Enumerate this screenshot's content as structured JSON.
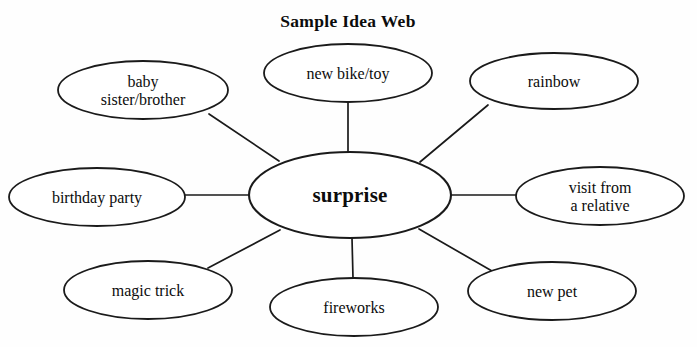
{
  "title": "Sample Idea Web",
  "diagram": {
    "type": "idea-web",
    "center": {
      "id": "surprise",
      "label": "surprise",
      "cx": 350,
      "cy": 195,
      "rx": 101,
      "ry": 43
    },
    "nodes": [
      {
        "id": "baby-sister-brother",
        "lines": [
          "baby",
          "sister/brother"
        ],
        "label": "baby sister/brother",
        "cx": 143,
        "cy": 90,
        "rx": 85,
        "ry": 29
      },
      {
        "id": "new-bike-toy",
        "lines": [
          "new bike/toy"
        ],
        "label": "new bike/toy",
        "cx": 348,
        "cy": 73,
        "rx": 84,
        "ry": 29
      },
      {
        "id": "rainbow",
        "lines": [
          "rainbow"
        ],
        "label": "rainbow",
        "cx": 554,
        "cy": 81,
        "rx": 84,
        "ry": 28
      },
      {
        "id": "visit-from-a-relative",
        "lines": [
          "visit from",
          "a relative"
        ],
        "label": "visit from a relative",
        "cx": 600,
        "cy": 196,
        "rx": 84,
        "ry": 29
      },
      {
        "id": "new-pet",
        "lines": [
          "new pet"
        ],
        "label": "new pet",
        "cx": 552,
        "cy": 291,
        "rx": 84,
        "ry": 29
      },
      {
        "id": "fireworks",
        "lines": [
          "fireworks"
        ],
        "label": "fireworks",
        "cx": 354,
        "cy": 307,
        "rx": 84,
        "ry": 29
      },
      {
        "id": "magic-trick",
        "lines": [
          "magic trick"
        ],
        "label": "magic trick",
        "cx": 148,
        "cy": 290,
        "rx": 84,
        "ry": 29
      },
      {
        "id": "birthday-party",
        "lines": [
          "birthday party"
        ],
        "label": "birthday party",
        "cx": 97,
        "cy": 197,
        "rx": 88,
        "ry": 29
      }
    ],
    "edges": [
      {
        "from": "surprise",
        "to": "baby-sister-brother",
        "x1": 279,
        "y1": 161,
        "x2": 209,
        "y2": 114
      },
      {
        "from": "surprise",
        "to": "new-bike-toy",
        "x1": 348,
        "y1": 152,
        "x2": 348,
        "y2": 102
      },
      {
        "from": "surprise",
        "to": "rainbow",
        "x1": 420,
        "y1": 162,
        "x2": 488,
        "y2": 105
      },
      {
        "from": "surprise",
        "to": "visit-from-a-relative",
        "x1": 451,
        "y1": 195,
        "x2": 516,
        "y2": 195
      },
      {
        "from": "surprise",
        "to": "new-pet",
        "x1": 419,
        "y1": 229,
        "x2": 492,
        "y2": 271
      },
      {
        "from": "surprise",
        "to": "fireworks",
        "x1": 352,
        "y1": 238,
        "x2": 353,
        "y2": 278
      },
      {
        "from": "surprise",
        "to": "magic-trick",
        "x1": 280,
        "y1": 230,
        "x2": 208,
        "y2": 268
      },
      {
        "from": "surprise",
        "to": "birthday-party",
        "x1": 249,
        "y1": 195,
        "x2": 184,
        "y2": 195
      }
    ],
    "colors": {
      "background": "#fefefe",
      "stroke": "#1a1a1a",
      "text": "#0c0c0c",
      "node_fill": "#ffffff"
    }
  }
}
